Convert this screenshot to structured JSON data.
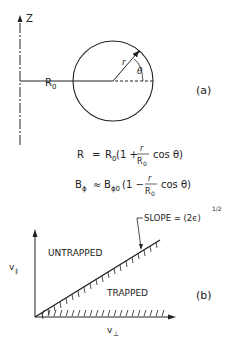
{
  "panel_a": {
    "axis_label": "Z",
    "major_radius_label": "R",
    "major_radius_sub": "0",
    "minor_radius_label": "r",
    "angle_label": "θ",
    "panel_tag": "(a)"
  },
  "equations": {
    "eq1_lhs": "R",
    "eq1_eq": "=",
    "eq1_rhs_a": "R",
    "eq1_rhs_sub": "0",
    "eq1_rhs_b": "(1 +",
    "eq1_frac_num": "r",
    "eq1_frac_den": "R",
    "eq1_frac_den_sub": "0",
    "eq1_rhs_c": "cos θ)",
    "eq2_lhs": "B",
    "eq2_lhs_sub": "ϕ",
    "eq2_eq": "≈",
    "eq2_rhs_a": "B",
    "eq2_rhs_sub": "ϕ0",
    "eq2_rhs_b": "(1 −",
    "eq2_frac_num": "r",
    "eq2_frac_den": "R",
    "eq2_frac_den_sub": "0",
    "eq2_rhs_c": "cos θ)"
  },
  "panel_b": {
    "y_axis_label": "v",
    "y_axis_sub": "∥",
    "x_axis_label": "v",
    "x_axis_sub": "⊥",
    "region_upper": "UNTRAPPED",
    "region_lower": "TRAPPED",
    "slope_label": "SLOPE ≃ (2ϵ)",
    "slope_exp": "1/2",
    "panel_tag": "(b)"
  }
}
